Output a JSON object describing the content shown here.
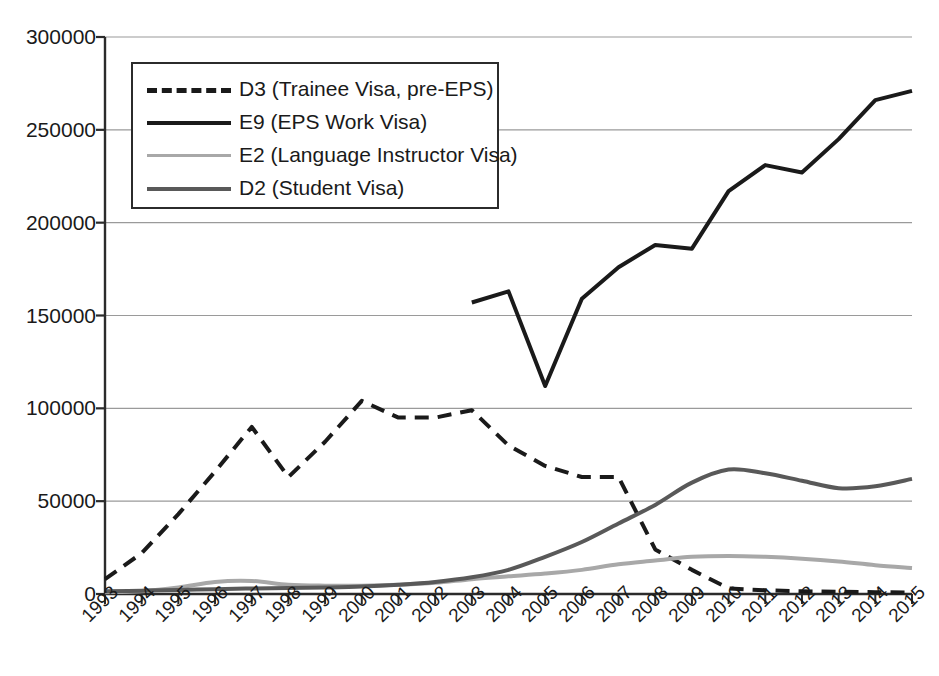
{
  "chart_data": {
    "type": "line",
    "title": "",
    "subtitle": "",
    "xlabel": "",
    "ylabel": "",
    "grid": true,
    "legend_position": "upper-left-inside",
    "xlim": [
      1993,
      2015
    ],
    "ylim": [
      0,
      300000
    ],
    "ytick_step": 50000,
    "ytick_labels": [
      "0",
      "50000",
      "100000",
      "150000",
      "200000",
      "250000",
      "300000"
    ],
    "ytick_values": [
      0,
      50000,
      100000,
      150000,
      200000,
      250000,
      300000
    ],
    "categories": [
      1993,
      1994,
      1995,
      1996,
      1997,
      1998,
      1999,
      2000,
      2001,
      2002,
      2003,
      2004,
      2005,
      2006,
      2007,
      2008,
      2009,
      2010,
      2011,
      2012,
      2013,
      2014,
      2015
    ],
    "xtick_labels": [
      "1993",
      "1994",
      "1995",
      "1996",
      "1997",
      "1998",
      "1999",
      "2000",
      "2001",
      "2002",
      "2003",
      "2004",
      "2005",
      "2006",
      "2007",
      "2008",
      "2009",
      "2010",
      "2011",
      "2012",
      "2013",
      "2014",
      "2015"
    ],
    "series": [
      {
        "name": "D3 (Trainee Visa, pre-EPS)",
        "key": "d3",
        "style": "dashed",
        "color": "#1a1a1a",
        "width": 4,
        "smooth": false,
        "values": [
          8000,
          22000,
          43000,
          66000,
          90000,
          63000,
          82000,
          104000,
          95000,
          95000,
          99000,
          80000,
          69000,
          63000,
          63000,
          24000,
          13000,
          3000,
          2000,
          1500,
          1200,
          1000,
          800
        ]
      },
      {
        "name": "E9 (EPS Work Visa)",
        "key": "e9",
        "style": "solid",
        "color": "#1a1a1a",
        "width": 4,
        "smooth": false,
        "values": [
          null,
          null,
          null,
          null,
          null,
          null,
          null,
          null,
          null,
          null,
          157000,
          163000,
          112000,
          159000,
          176000,
          188000,
          186000,
          217000,
          231000,
          227000,
          245000,
          266000,
          271000
        ]
      },
      {
        "name": "E2 (Language Instructor Visa)",
        "key": "e2",
        "style": "solid",
        "color": "#a8a8a8",
        "width": 4,
        "smooth": true,
        "values": [
          1000,
          1500,
          3500,
          6500,
          7000,
          5000,
          4500,
          4500,
          5000,
          6000,
          8000,
          9500,
          11000,
          13000,
          16000,
          18000,
          20000,
          20500,
          20000,
          19000,
          17500,
          15500,
          14000
        ]
      },
      {
        "name": "D2 (Student Visa)",
        "key": "d2",
        "style": "solid",
        "color": "#595959",
        "width": 4,
        "smooth": true,
        "values": [
          1500,
          1800,
          2200,
          2600,
          3000,
          3200,
          3500,
          4000,
          5000,
          6500,
          9000,
          13000,
          20000,
          28000,
          38000,
          48000,
          60000,
          67000,
          65000,
          61000,
          57000,
          58000,
          62000
        ]
      }
    ]
  },
  "legend": {
    "items": [
      {
        "label": "D3 (Trainee Visa, pre-EPS)",
        "style": "dashed",
        "color": "#1a1a1a"
      },
      {
        "label": "E9 (EPS Work Visa)",
        "style": "solid",
        "color": "#1a1a1a"
      },
      {
        "label": "E2 (Language Instructor Visa)",
        "style": "solid",
        "color": "#a8a8a8"
      },
      {
        "label": "D2 (Student Visa)",
        "style": "solid",
        "color": "#595959"
      }
    ]
  },
  "colors": {
    "axis": "#2b2b2b",
    "grid": "#9a9a9a",
    "background": "#ffffff",
    "text": "#1a1a1a"
  }
}
